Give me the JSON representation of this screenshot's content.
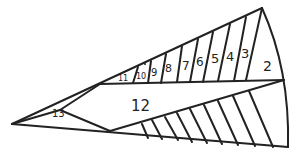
{
  "diagram": {
    "stroke_color": "#222222",
    "background": "#ffffff",
    "regions": [
      {
        "label": "2",
        "x": 268,
        "y": 66,
        "size": 14
      },
      {
        "label": "3",
        "x": 244,
        "y": 53,
        "size": 13
      },
      {
        "label": "4",
        "x": 229,
        "y": 56,
        "size": 13
      },
      {
        "label": "5",
        "x": 214,
        "y": 58,
        "size": 13
      },
      {
        "label": "6",
        "x": 199,
        "y": 61,
        "size": 12
      },
      {
        "label": "7",
        "x": 185,
        "y": 65,
        "size": 12
      },
      {
        "label": "8",
        "x": 168,
        "y": 67,
        "size": 11
      },
      {
        "label": "9",
        "x": 154,
        "y": 71,
        "size": 10
      },
      {
        "label": "10",
        "x": 141,
        "y": 74,
        "size": 8
      },
      {
        "label": "11",
        "x": 122,
        "y": 78,
        "size": 8
      },
      {
        "label": "12",
        "x": 139,
        "y": 106,
        "size": 15
      },
      {
        "label": "13",
        "x": 58,
        "y": 114,
        "size": 10
      }
    ]
  }
}
